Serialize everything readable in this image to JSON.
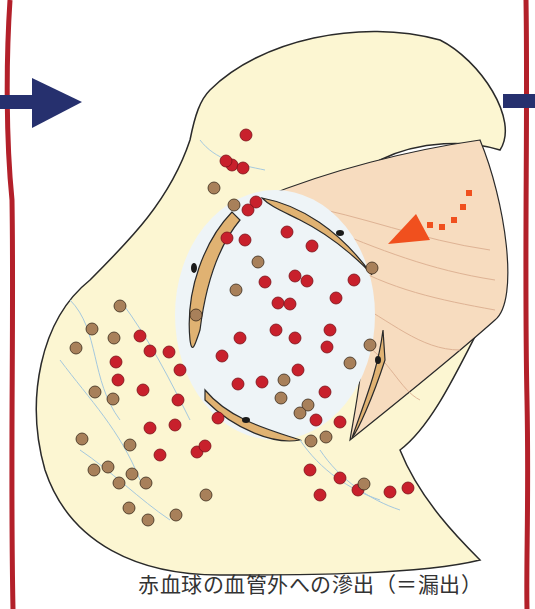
{
  "caption": "赤血球の血管外への滲出（＝漏出）",
  "colors": {
    "background": "#ffffff",
    "frame_line": "#b3202a",
    "nav_arrow": "#26306e",
    "tissue_fill": "#fcf6d2",
    "tissue_outline": "#2a2a2a",
    "vessel_wall": "#e0b272",
    "vessel_lumen": "#eef4f7",
    "red_blood_cell": "#c8202c",
    "white_blood_cell": "#a8805a",
    "flow_arrow": "#f0501e",
    "fibrin": "#9cc4e0",
    "nucleus": "#1a1a1a"
  },
  "labels": {
    "prev_arrow": "previous",
    "next_arrow": "next"
  }
}
